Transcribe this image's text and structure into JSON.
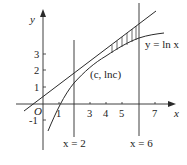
{
  "diagram": {
    "axes": {
      "x_label": "x",
      "y_label": "y",
      "origin_label": "O"
    },
    "x_ticks": [
      "1",
      "3",
      "4",
      "5",
      "7"
    ],
    "y_ticks": [
      "3",
      "2",
      "1",
      "-1"
    ],
    "curve_label": "y = ln x",
    "point_label": "(c, lnc)",
    "vertical_lines": [
      {
        "label": "x = 2"
      },
      {
        "label": "x = 6"
      }
    ],
    "colors": {
      "stroke": "#2a2a2a",
      "background": "#ffffff"
    }
  }
}
